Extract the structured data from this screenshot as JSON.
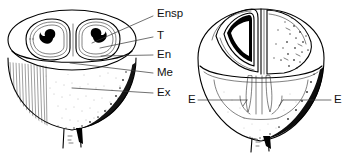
{
  "figure": {
    "background_color": "#ffffff",
    "ink_color": "#000000",
    "label_color": "#111111",
    "leader_color": "#333333",
    "width": 347,
    "height": 153
  },
  "left_diagram": {
    "name": "Transverse cut fruit with two seed locules",
    "labels": [
      {
        "key": "ensp",
        "text": "Ensp",
        "x": 157,
        "y": 14,
        "leader_from_x": 153,
        "leader_from_y": 16,
        "leader_to_x": 92,
        "leader_to_y": 43
      },
      {
        "key": "t",
        "text": "T",
        "x": 157,
        "y": 36,
        "leader_from_x": 153,
        "leader_from_y": 37,
        "leader_to_x": 100,
        "leader_to_y": 48
      },
      {
        "key": "en",
        "text": "En",
        "x": 157,
        "y": 55,
        "leader_from_x": 153,
        "leader_from_y": 55,
        "leader_to_x": 101,
        "leader_to_y": 56
      },
      {
        "key": "me",
        "text": "Me",
        "x": 157,
        "y": 73,
        "leader_from_x": 153,
        "leader_from_y": 73,
        "leader_to_x": 70,
        "leader_to_y": 63
      },
      {
        "key": "ex",
        "text": "Ex",
        "x": 157,
        "y": 93,
        "leader_from_x": 153,
        "leader_from_y": 93,
        "leader_to_x": 72,
        "leader_to_y": 88
      }
    ]
  },
  "right_diagram": {
    "name": "Longitudinal cut fruit showing embryos",
    "labels": [
      {
        "key": "e-left",
        "text": "E",
        "x": 190,
        "y": 100,
        "leader_from_x": 198,
        "leader_from_y": 100,
        "leader_to_x": 247,
        "leader_to_y": 100
      },
      {
        "key": "e-right",
        "text": "E",
        "x": 334,
        "y": 100,
        "leader_from_x": 331,
        "leader_from_y": 100,
        "leader_to_x": 283,
        "leader_to_y": 100
      }
    ]
  },
  "legend_keys": [
    {
      "abbr": "Ensp",
      "meaning": "Endosperm"
    },
    {
      "abbr": "T",
      "meaning": "Testa"
    },
    {
      "abbr": "En",
      "meaning": "Endocarp"
    },
    {
      "abbr": "Me",
      "meaning": "Mesocarp"
    },
    {
      "abbr": "Ex",
      "meaning": "Exocarp"
    },
    {
      "abbr": "E",
      "meaning": "Embryo"
    }
  ]
}
